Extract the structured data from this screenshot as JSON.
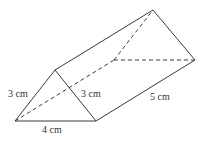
{
  "figure": {
    "type": "triangular-prism",
    "stroke_color": "#3a3a3a",
    "hidden_edge_style": "dashed"
  },
  "labels": {
    "left_edge": "3 cm",
    "right_front_edge": "3 cm",
    "base_edge": "4 cm",
    "length_edge": "5 cm"
  },
  "vertices": {
    "front_left": [
      15,
      121
    ],
    "front_apex": [
      55,
      70
    ],
    "front_right": [
      96,
      121
    ],
    "back_left": [
      114,
      60
    ],
    "back_apex": [
      153,
      10
    ],
    "back_right": [
      195,
      60
    ]
  }
}
